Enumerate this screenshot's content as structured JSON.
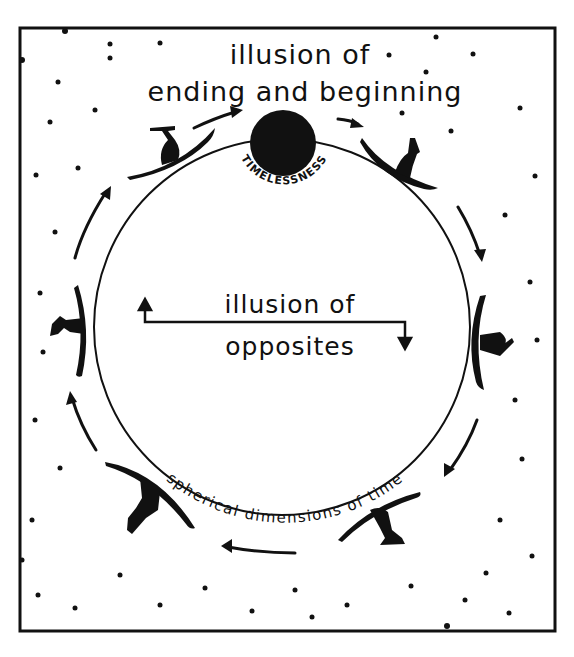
{
  "diagram": {
    "top_label_line1": "illusion of",
    "top_label_line2": "ending and beginning",
    "center_label_line1": "illusion of",
    "center_label_line2": "opposites",
    "circle_label": "spherical dimensions of time",
    "top_node_label": "TIMELESSNESS",
    "figures": [
      {
        "name": "surfer-top-left",
        "position": "upper-left"
      },
      {
        "name": "surfer-top-right",
        "position": "upper-right"
      },
      {
        "name": "surfer-right",
        "position": "right"
      },
      {
        "name": "surfer-bottom-right",
        "position": "lower-right"
      },
      {
        "name": "surfer-bottom-left",
        "position": "lower-left"
      },
      {
        "name": "surfer-left",
        "position": "left"
      }
    ],
    "flow_direction": "clockwise",
    "colors": {
      "ink": "#111111",
      "paper": "#ffffff"
    }
  }
}
